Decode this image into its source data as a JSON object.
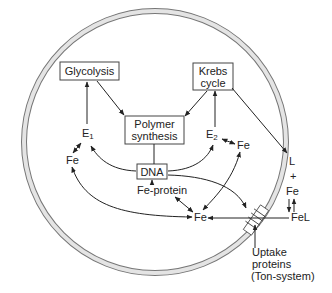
{
  "diagram": {
    "type": "bacterial cell iron metabolism schematic",
    "nodes": {
      "glycolysis": "Glycolysis",
      "krebs_line1": "Krebs",
      "krebs_line2": "cycle",
      "polymer_line1": "Polymer",
      "polymer_line2": "synthesis",
      "dna": "DNA",
      "e1": "E",
      "e1_sub": "1",
      "e2": "E",
      "e2_sub": "2",
      "fe_left": "Fe",
      "fe_right": "Fe",
      "fe_center": "Fe",
      "fe_protein": "Fe-protein",
      "l": "L",
      "plus": "+",
      "fe_outside": "Fe",
      "fel": "FeL",
      "uptake_line1": "Uptake",
      "uptake_line2": "proteins",
      "uptake_line3": "(Ton-system)"
    },
    "colors": {
      "membrane_fill": "#e4e4e4",
      "membrane_stroke": "#777777",
      "line": "#222222"
    }
  }
}
